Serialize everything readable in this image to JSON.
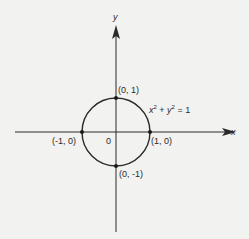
{
  "diagram": {
    "type": "coordinate-plot",
    "axes": {
      "x_label": "x",
      "y_label": "y",
      "origin_label": "0"
    },
    "curve": {
      "equation_lhs_x": "x",
      "equation_exp1": "2",
      "equation_plus": " + ",
      "equation_lhs_y": "y",
      "equation_exp2": "2",
      "equation_rhs": " = 1",
      "center": [
        0,
        0
      ],
      "radius": 1
    },
    "points": [
      {
        "label": "(0, 1)",
        "x": 0,
        "y": 1
      },
      {
        "label": "(-1, 0)",
        "x": -1,
        "y": 0
      },
      {
        "label": "(1, 0)",
        "x": 1,
        "y": 0
      },
      {
        "label": "(0, -1)",
        "x": 0,
        "y": -1
      }
    ],
    "colors": {
      "stroke": "#2a2a2a",
      "background": "#f2f2f0"
    }
  }
}
